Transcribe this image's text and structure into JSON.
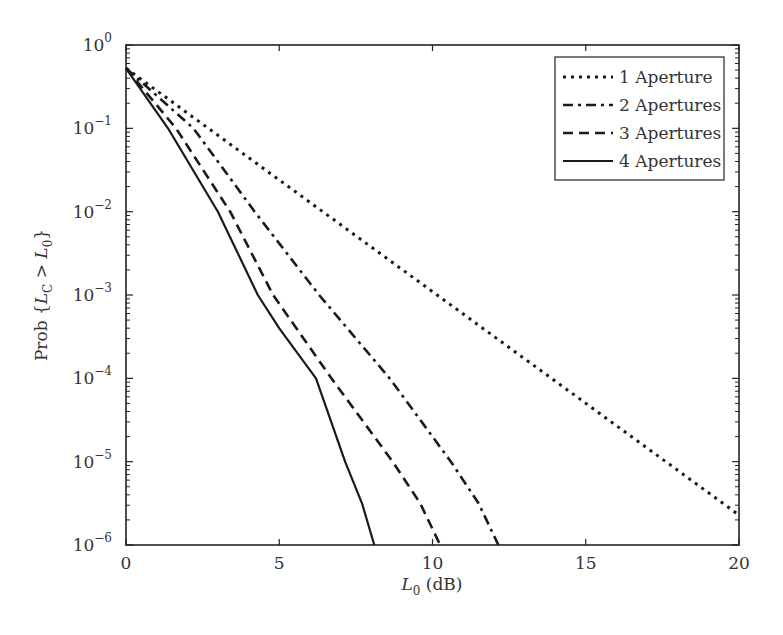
{
  "chart_data": {
    "type": "line",
    "title": "",
    "xlabel": "L0 (dB)",
    "ylabel": "Prob {LC > L0}",
    "xlim": [
      0,
      20
    ],
    "ylim": [
      1e-06,
      1
    ],
    "yscale": "log",
    "grid": false,
    "legend_position": "upper right",
    "x_ticks": [
      0,
      5,
      10,
      15,
      20
    ],
    "x_tick_labels": [
      "0",
      "5",
      "10",
      "15",
      "20"
    ],
    "y_ticks_exp": [
      0,
      -1,
      -2,
      -3,
      -4,
      -5,
      -6
    ],
    "y_tick_labels": [
      "10^0",
      "10^-1",
      "10^-2",
      "10^-3",
      "10^-4",
      "10^-5",
      "10^-6"
    ],
    "series": [
      {
        "name": "1 Aperture",
        "style": "dotted",
        "x": [
          0,
          20
        ],
        "log10_y": [
          -0.28,
          -5.64
        ],
        "y": [
          0.52,
          2.3e-06
        ]
      },
      {
        "name": "2 Apertures",
        "style": "dashdot",
        "x": [
          0,
          2.2,
          4.2,
          6.3,
          8.6,
          10.6,
          11.5,
          12.15
        ],
        "log10_y": [
          -0.28,
          -1,
          -2,
          -3,
          -4,
          -5,
          -5.5,
          -6
        ],
        "y": [
          0.52,
          0.1,
          0.01,
          0.001,
          0.0001,
          1e-05,
          3.2e-06,
          1e-06
        ]
      },
      {
        "name": "3 Apertures",
        "style": "dashed",
        "x": [
          0,
          1.63,
          3.4,
          4.8,
          6.7,
          8.7,
          9.6,
          10.25
        ],
        "log10_y": [
          -0.28,
          -1,
          -2,
          -3,
          -4,
          -5,
          -5.5,
          -6
        ],
        "y": [
          0.52,
          0.1,
          0.01,
          0.001,
          0.0001,
          1e-05,
          3.2e-06,
          1e-06
        ]
      },
      {
        "name": "4 Apertures",
        "style": "solid",
        "x": [
          0,
          1.37,
          3.0,
          4.3,
          5.0,
          6.2,
          7.15,
          7.7,
          8.1
        ],
        "log10_y": [
          -0.28,
          -1,
          -2,
          -3,
          -3.4,
          -4,
          -5,
          -5.5,
          -6
        ],
        "y": [
          0.52,
          0.1,
          0.01,
          0.001,
          0.0004,
          0.0001,
          1e-05,
          3.2e-06,
          1e-06
        ]
      }
    ]
  },
  "labels": {
    "xlabel_main": "L",
    "xlabel_sub": "0",
    "xlabel_rest": " (dB)",
    "ylabel_prefix": "Prob {",
    "ylabel_L1": "L",
    "ylabel_sub1": "C",
    "ylabel_mid": " > ",
    "ylabel_L2": "L",
    "ylabel_sub2": "0",
    "ylabel_suffix": "}"
  }
}
